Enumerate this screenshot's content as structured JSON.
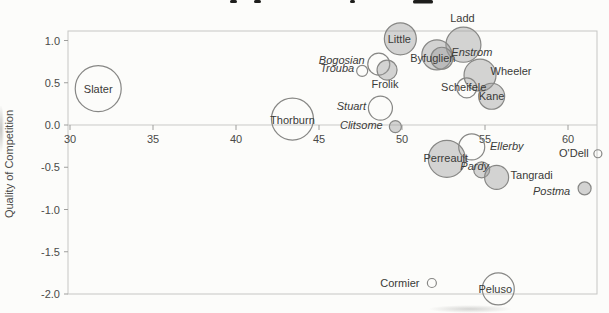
{
  "figure": {
    "ylabel": "Quality of Competition",
    "colors": {
      "bubble_stroke": "#878785",
      "bubble_fill_gray": "#9c9c9a",
      "axis": "#c6c6c4",
      "text": "#3a3a38"
    }
  },
  "chart_data": {
    "type": "scatter",
    "subtype": "bubble",
    "xlabel": "",
    "ylabel": "Quality of Competition",
    "xlim": [
      29.9,
      61.9
    ],
    "ylim": [
      -2.0,
      1.11
    ],
    "x_ticks": [
      30,
      35,
      40,
      45,
      50,
      55,
      60
    ],
    "y_ticks": [
      "1.0",
      "0.5",
      "0.0",
      "-0.5",
      "-1.0",
      "-1.5",
      "-2.0"
    ],
    "grid": false,
    "legend": false,
    "series": [
      {
        "name": "Slater",
        "x": 31.7,
        "y": 0.43,
        "r": 23,
        "fill": "open",
        "italic": false,
        "label_dx": 0,
        "label_dy": 0
      },
      {
        "name": "Thorburn",
        "x": 43.4,
        "y": 0.07,
        "r": 21,
        "fill": "open",
        "italic": false,
        "label_dx": 0,
        "label_dy": 1
      },
      {
        "name": "Little",
        "x": 49.9,
        "y": 1.02,
        "r": 16,
        "fill": "gray",
        "italic": false,
        "label_dx": -1,
        "label_dy": 0
      },
      {
        "name": "Ladd",
        "x": 53.7,
        "y": 0.95,
        "r": 17.5,
        "fill": "gray",
        "italic": false,
        "label_dx": -1,
        "label_dy": -27
      },
      {
        "name": "Byfuglien",
        "x": 52.1,
        "y": 0.83,
        "r": 15,
        "fill": "gray",
        "italic": false,
        "label_dx": -4,
        "label_dy": 3
      },
      {
        "name": "Enstrom",
        "x": 52.4,
        "y": 0.79,
        "r": 11,
        "fill": "gray",
        "italic": true,
        "label_dx": 30,
        "label_dy": -6
      },
      {
        "name": "Bogosian",
        "x": 48.6,
        "y": 0.72,
        "r": 11,
        "fill": "open",
        "italic": true,
        "label_dx": -37,
        "label_dy": -4
      },
      {
        "name": "Trouba",
        "x": 47.6,
        "y": 0.64,
        "r": 5.5,
        "fill": "open",
        "italic": true,
        "label_dx": -25,
        "label_dy": -3
      },
      {
        "name": "Frolik",
        "x": 49.1,
        "y": 0.65,
        "r": 10,
        "fill": "gray",
        "italic": false,
        "label_dx": -2,
        "label_dy": 14
      },
      {
        "name": "Wheeler",
        "x": 54.7,
        "y": 0.59,
        "r": 16,
        "fill": "gray",
        "italic": false,
        "label_dx": 31,
        "label_dy": -4
      },
      {
        "name": "Scheifele",
        "x": 53.9,
        "y": 0.44,
        "r": 10,
        "fill": "open",
        "italic": false,
        "label_dx": -3,
        "label_dy": -1
      },
      {
        "name": "Kane",
        "x": 55.4,
        "y": 0.34,
        "r": 13,
        "fill": "gray",
        "italic": false,
        "label_dx": 0,
        "label_dy": 0
      },
      {
        "name": "Stuart",
        "x": 48.7,
        "y": 0.2,
        "r": 12,
        "fill": "open",
        "italic": true,
        "label_dx": -29,
        "label_dy": -2
      },
      {
        "name": "Clitsome",
        "x": 49.6,
        "y": -0.02,
        "r": 6,
        "fill": "gray",
        "italic": true,
        "label_dx": -34,
        "label_dy": -2
      },
      {
        "name": "Perreault",
        "x": 52.7,
        "y": -0.4,
        "r": 18.5,
        "fill": "gray",
        "italic": false,
        "label_dx": -1,
        "label_dy": -1
      },
      {
        "name": "Ellerby",
        "x": 54.2,
        "y": -0.26,
        "r": 13,
        "fill": "open",
        "italic": true,
        "label_dx": 35,
        "label_dy": -1
      },
      {
        "name": "Pardy",
        "x": 54.8,
        "y": -0.53,
        "r": 8,
        "fill": "gray",
        "italic": true,
        "label_dx": -7,
        "label_dy": -4
      },
      {
        "name": "Tangradi",
        "x": 55.7,
        "y": -0.62,
        "r": 12,
        "fill": "gray",
        "italic": false,
        "label_dx": 35,
        "label_dy": -2
      },
      {
        "name": "O'Dell",
        "x": 61.8,
        "y": -0.34,
        "r": 4,
        "fill": "open",
        "italic": false,
        "label_dx": -24,
        "label_dy": -1
      },
      {
        "name": "Postma",
        "x": 61.0,
        "y": -0.75,
        "r": 6.5,
        "fill": "gray",
        "italic": true,
        "label_dx": -33,
        "label_dy": 3
      },
      {
        "name": "Cormier",
        "x": 51.8,
        "y": -1.87,
        "r": 4.5,
        "fill": "open",
        "italic": false,
        "label_dx": -32,
        "label_dy": 0
      },
      {
        "name": "Peluso",
        "x": 55.8,
        "y": -1.94,
        "r": 16,
        "fill": "open",
        "italic": false,
        "label_dx": -3,
        "label_dy": 0
      }
    ]
  }
}
